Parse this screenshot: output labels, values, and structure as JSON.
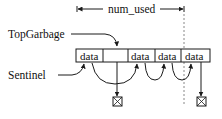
{
  "diagram": {
    "range_label": "num_used",
    "labels": {
      "top_garbage": "TopGarbage",
      "sentinel": "Sentinel"
    },
    "cells": [
      {
        "text": "data"
      },
      {
        "text": ""
      },
      {
        "text": "data"
      },
      {
        "text": "data"
      },
      {
        "text": "data"
      }
    ],
    "colors": {
      "stroke": "#1a1a1a",
      "dashed": "#888888",
      "background": "#ffffff"
    }
  }
}
